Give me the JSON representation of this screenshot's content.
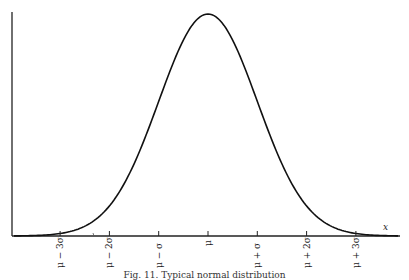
{
  "chart_data": {
    "type": "line",
    "title": "Fig. 11. Typical normal distribution",
    "xlabel": "x",
    "ylabel": "",
    "x": [
      "μ − 3σ",
      "μ − 2σ",
      "μ − σ",
      "μ",
      "μ + σ",
      "μ + 2σ",
      "μ + 3σ"
    ],
    "x_sigma": [
      -3,
      -2,
      -1,
      0,
      1,
      2,
      3
    ],
    "series": [
      {
        "name": "normal density",
        "values": [
          0.0044,
          0.054,
          0.242,
          0.399,
          0.242,
          0.054,
          0.0044
        ]
      }
    ],
    "xlim": [
      -4,
      4
    ],
    "grid": false,
    "legend": "none"
  },
  "axis": {
    "x_label": "x",
    "ticks": [
      "μ − 3σ",
      "μ − 2σ",
      "μ − σ",
      "μ",
      "μ + σ",
      "μ + 2σ",
      "μ + 3σ"
    ]
  },
  "caption": "Fig. 11. Typical normal distribution"
}
